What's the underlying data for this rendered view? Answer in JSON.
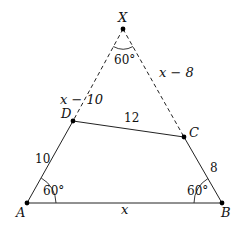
{
  "diagram": {
    "points": {
      "X": {
        "label": "X",
        "x": 123,
        "y": 29
      },
      "D": {
        "label": "D",
        "x": 73,
        "y": 121
      },
      "C": {
        "label": "C",
        "x": 184,
        "y": 137
      },
      "A": {
        "label": "A",
        "x": 27,
        "y": 203
      },
      "B": {
        "label": "B",
        "x": 222,
        "y": 203
      }
    },
    "segments": {
      "XD": {
        "label": "x − 10",
        "style": "dashed"
      },
      "XC": {
        "label": "x − 8",
        "style": "dashed"
      },
      "DC": {
        "label": "12",
        "style": "solid"
      },
      "AD": {
        "label": "10",
        "style": "solid"
      },
      "BC": {
        "label": "8",
        "style": "solid"
      },
      "AB": {
        "label": "x",
        "style": "solid"
      }
    },
    "angles": {
      "X": "60°",
      "A": "60°",
      "B": "60°"
    }
  }
}
